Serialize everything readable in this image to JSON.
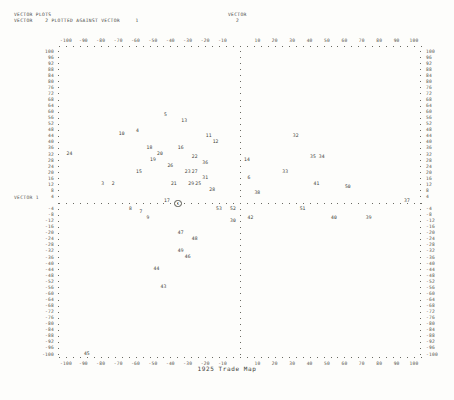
{
  "header": {
    "title": "VECTOR PLOTS",
    "subtitle": "VECTOR    2 PLOTTED AGAINST VECTOR     1",
    "right_label_line1": "VECTOR",
    "right_label_line2": "2"
  },
  "axes": {
    "x_label_bottom": "1925 Trade Map",
    "y_axis_name": "VECTOR 1",
    "x_ticks": [
      "-100",
      "-90",
      "-80",
      "-70",
      "-60",
      "-50",
      "-40",
      "-30",
      "-20",
      "-10",
      "0",
      "10",
      "20",
      "30",
      "40",
      "50",
      "60",
      "70",
      "80",
      "90",
      "100"
    ],
    "y_ticks": [
      "100",
      "96",
      "92",
      "88",
      "84",
      "80",
      "76",
      "72",
      "68",
      "64",
      "60",
      "56",
      "52",
      "48",
      "44",
      "40",
      "36",
      "32",
      "28",
      "24",
      "20",
      "16",
      "12",
      "8",
      "4",
      "0",
      "-4",
      "-8",
      "-12",
      "-16",
      "-20",
      "-24",
      "-28",
      "-32",
      "-36",
      "-40",
      "-44",
      "-48",
      "-52",
      "-56",
      "-60",
      "-64",
      "-68",
      "-72",
      "-76",
      "-80",
      "-84",
      "-88",
      "-92",
      "-96",
      "-100"
    ],
    "x_range": [
      -110,
      110
    ],
    "y_range": [
      -103,
      103
    ],
    "grid": false
  },
  "chart_data": {
    "type": "scatter",
    "title": "VECTOR PLOTS",
    "subtitle": "VECTOR    2 PLOTTED AGAINST VECTOR     1",
    "xlabel": "1925 Trade Map",
    "ylabel": "VECTOR 1",
    "xlim": [
      -110,
      110
    ],
    "ylim": [
      -103,
      103
    ],
    "grid": false,
    "legend": "none",
    "point_label_field": "id",
    "points": [
      {
        "id": "5",
        "x": -42,
        "y": 58
      },
      {
        "id": "13",
        "x": -32,
        "y": 54
      },
      {
        "id": "10",
        "x": -68,
        "y": 45
      },
      {
        "id": "4",
        "x": -58,
        "y": 47
      },
      {
        "id": "11",
        "x": -18,
        "y": 44
      },
      {
        "id": "32",
        "x": 32,
        "y": 44
      },
      {
        "id": "12",
        "x": -14,
        "y": 40
      },
      {
        "id": "18",
        "x": -52,
        "y": 36
      },
      {
        "id": "16",
        "x": -34,
        "y": 36
      },
      {
        "id": "24",
        "x": -98,
        "y": 32
      },
      {
        "id": "20",
        "x": -46,
        "y": 32
      },
      {
        "id": "19",
        "x": -50,
        "y": 28
      },
      {
        "id": "22",
        "x": -26,
        "y": 30
      },
      {
        "id": "36",
        "x": -20,
        "y": 26
      },
      {
        "id": "14",
        "x": 4,
        "y": 28
      },
      {
        "id": "35",
        "x": 42,
        "y": 30
      },
      {
        "id": "34",
        "x": 47,
        "y": 30
      },
      {
        "id": "26",
        "x": -40,
        "y": 24
      },
      {
        "id": "15",
        "x": -58,
        "y": 20
      },
      {
        "id": "23",
        "x": -30,
        "y": 20
      },
      {
        "id": "27",
        "x": -26,
        "y": 20
      },
      {
        "id": "33",
        "x": 26,
        "y": 20
      },
      {
        "id": "31",
        "x": -20,
        "y": 16
      },
      {
        "id": "6",
        "x": 6,
        "y": 16
      },
      {
        "id": "3",
        "x": -78,
        "y": 12
      },
      {
        "id": "2",
        "x": -72,
        "y": 12
      },
      {
        "id": "21",
        "x": -38,
        "y": 12
      },
      {
        "id": "29",
        "x": -28,
        "y": 12
      },
      {
        "id": "25",
        "x": -24,
        "y": 12
      },
      {
        "id": "41",
        "x": 44,
        "y": 12
      },
      {
        "id": "28",
        "x": -16,
        "y": 8
      },
      {
        "id": "38",
        "x": 10,
        "y": 6
      },
      {
        "id": "17",
        "x": -42,
        "y": 1
      },
      {
        "id": "1",
        "x": -36,
        "y": 0
      },
      {
        "id": "37",
        "x": 96,
        "y": 1
      },
      {
        "id": "8",
        "x": -62,
        "y": -4
      },
      {
        "id": "53",
        "x": -12,
        "y": -4
      },
      {
        "id": "52",
        "x": -4,
        "y": -4
      },
      {
        "id": "51",
        "x": 36,
        "y": -4
      },
      {
        "id": "7",
        "x": -56,
        "y": -6
      },
      {
        "id": "9",
        "x": -52,
        "y": -10
      },
      {
        "id": "42",
        "x": 6,
        "y": -10
      },
      {
        "id": "30",
        "x": -4,
        "y": -12
      },
      {
        "id": "40",
        "x": 54,
        "y": -10
      },
      {
        "id": "39",
        "x": 74,
        "y": -10
      },
      {
        "id": "50",
        "x": 62,
        "y": 10
      },
      {
        "id": "47",
        "x": -34,
        "y": -20
      },
      {
        "id": "48",
        "x": -26,
        "y": -24
      },
      {
        "id": "49",
        "x": -34,
        "y": -32
      },
      {
        "id": "46",
        "x": -30,
        "y": -36
      },
      {
        "id": "44",
        "x": -48,
        "y": -44
      },
      {
        "id": "43",
        "x": -44,
        "y": -56
      },
      {
        "id": "45",
        "x": -88,
        "y": -100
      }
    ]
  }
}
